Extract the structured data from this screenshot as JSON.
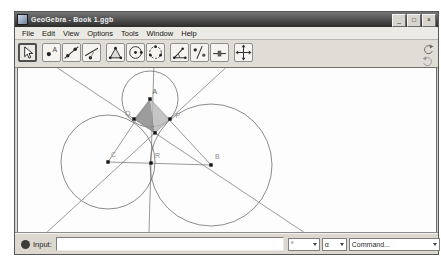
{
  "window": {
    "title": "GeoGebra - Book 1.ggb",
    "controls": [
      {
        "name": "minimize",
        "glyph": "_"
      },
      {
        "name": "maximize",
        "glyph": "□"
      },
      {
        "name": "close",
        "glyph": "×"
      }
    ]
  },
  "menu_items": [
    "File",
    "Edit",
    "View",
    "Options",
    "Tools",
    "Window",
    "Help"
  ],
  "toolbar": {
    "selected_tool": "move",
    "tools": [
      "move",
      "new-point",
      "line-through-two-points",
      "perpendicular-line",
      "polygon",
      "circle-with-center-through-point",
      "circle-through-three-points",
      "angle",
      "reflect-object-about-line",
      "slider",
      "move-drawing-pad"
    ]
  },
  "input_bar": {
    "label": "Input:",
    "value": "",
    "symbol_dropdown_value": "°",
    "greek_dropdown_value": "α",
    "command_dropdown_value": "Command..."
  },
  "geometry": {
    "width": 418,
    "height": 164,
    "stroke": "#6f6f6f",
    "label_color": "#8f8f8f",
    "point_color": "#141414",
    "points": [
      {
        "id": "A",
        "x": 132,
        "y": 31,
        "label": "A",
        "lx": 134.5,
        "ly": 25.5,
        "dark": true
      },
      {
        "id": "Q",
        "x": 116,
        "y": 51,
        "label": "Q",
        "lx": 107,
        "ly": 47.5
      },
      {
        "id": "P",
        "x": 152,
        "y": 51,
        "label": "P",
        "lx": 157.5,
        "ly": 49.5
      },
      {
        "id": "X",
        "x": 137,
        "y": 64.9,
        "label": ""
      },
      {
        "id": "C",
        "x": 90,
        "y": 94,
        "label": "C",
        "lx": 93,
        "ly": 88.5
      },
      {
        "id": "R",
        "x": 133,
        "y": 95,
        "label": "R",
        "lx": 137,
        "ly": 89.5
      },
      {
        "id": "B",
        "x": 193,
        "y": 97,
        "label": "B",
        "lx": 197,
        "ly": 90.5
      }
    ],
    "circles": [
      {
        "center": "A",
        "cx": 132,
        "cy": 31,
        "r": 28
      },
      {
        "center": "C",
        "cx": 90,
        "cy": 94,
        "r": 47
      },
      {
        "center": "B",
        "cx": 193,
        "cy": 97,
        "r": 61
      }
    ],
    "segments": [
      [
        "A",
        "C"
      ],
      [
        "A",
        "B"
      ],
      [
        "C",
        "B"
      ]
    ],
    "lines": [
      {
        "name": "tangent-q",
        "x1": 39.5,
        "y1": 0,
        "x2": 285.5,
        "y2": 164
      },
      {
        "name": "tangent-p",
        "x1": 207.4,
        "y1": 0,
        "x2": 29.2,
        "y2": 164
      },
      {
        "name": "tangent-r",
        "x1": 135.8,
        "y1": 0,
        "x2": 131,
        "y2": 164
      }
    ],
    "polygons": [
      {
        "pts": [
          "A",
          "Q",
          "X"
        ],
        "fill": "#8b8b8b",
        "opacity": 0.85
      },
      {
        "pts": [
          "A",
          "X",
          "P"
        ],
        "fill": "#b6b6b6",
        "opacity": 0.8
      }
    ]
  }
}
